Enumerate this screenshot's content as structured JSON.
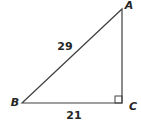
{
  "figure": {
    "type": "right-triangle-diagram",
    "vertices": {
      "a": "A",
      "b": "B",
      "c": "C"
    },
    "sides": {
      "hypotenuse_ba_label": "29",
      "base_bc_label": "21"
    },
    "right_angle_at": "C",
    "colors": {
      "line": "#404040",
      "text": "#262626",
      "background": "#ffffff"
    }
  }
}
